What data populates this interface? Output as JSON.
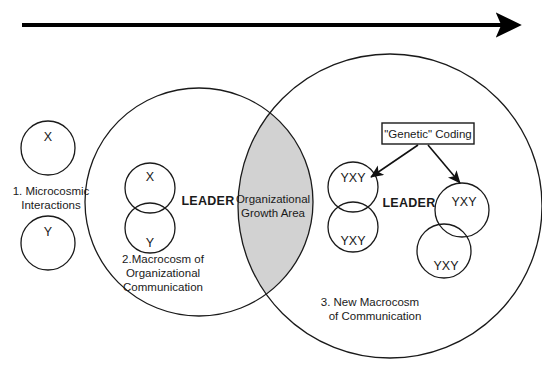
{
  "diagram": {
    "background_color": "#ffffff",
    "stroke_color": "#1a1a1a",
    "lens_fill_color": "#d2d2d2",
    "timeline_arrow": {
      "name": "time-progression-arrow",
      "direction": "left-to-right"
    },
    "left_microcosm": {
      "circle_x_label": "X",
      "circle_y_label": "Y",
      "caption_line1": "1. Microcosmic",
      "caption_line2": "Interactions"
    },
    "left_macrocosm": {
      "leader_label": "LEADER",
      "inner_x_label": "X",
      "inner_y_label": "Y",
      "caption_line1": "2.Macrocosm of",
      "caption_line2": "Organizational",
      "caption_line3": "Communication"
    },
    "overlap": {
      "label_line1": "Organizational",
      "label_line2": "Growth Area"
    },
    "right_macrocosm": {
      "leader_label": "LEADER",
      "coding_box_label": "\"Genetic\" Coding",
      "node_labels": [
        "YXY",
        "YXY",
        "YXY",
        "YXY"
      ],
      "caption_line1": "3. New Macrocosm",
      "caption_line2": "of Communication"
    }
  }
}
